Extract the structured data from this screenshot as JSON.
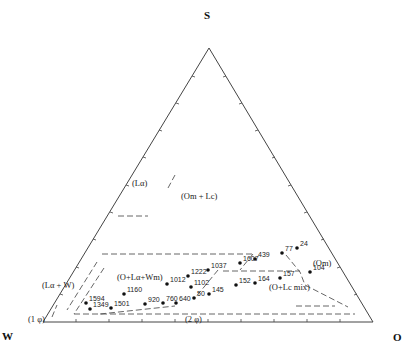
{
  "diagram": {
    "type": "ternary phase diagram",
    "vertices": {
      "top": "S",
      "left": "W",
      "right": "O"
    },
    "regions": {
      "l_alpha": "(Lα)",
      "om_lc": "(Om + Lc)",
      "o_lalpha_wm": "(O+Lα+Wm)",
      "om": "(Om)",
      "l_alpha_w": "(Lα + W)",
      "one_phi": "(1 φ)",
      "two_phi": "(2 φ)",
      "o_lc_mix": "(O+Lc mix)"
    },
    "points": [
      {
        "label": "24",
        "x": 297,
        "y": 248
      },
      {
        "label": "77",
        "x": 282,
        "y": 253
      },
      {
        "label": "439",
        "x": 255,
        "y": 259
      },
      {
        "label": "1607",
        "x": 240,
        "y": 263
      },
      {
        "label": "1037",
        "x": 208,
        "y": 270
      },
      {
        "label": "1222",
        "x": 188,
        "y": 276
      },
      {
        "label": "157",
        "x": 280,
        "y": 278
      },
      {
        "label": "104",
        "x": 310,
        "y": 272
      },
      {
        "label": "1012",
        "x": 167,
        "y": 284
      },
      {
        "label": "1102",
        "x": 191,
        "y": 287
      },
      {
        "label": "1160",
        "x": 124,
        "y": 294
      },
      {
        "label": "164",
        "x": 255,
        "y": 283
      },
      {
        "label": "152",
        "x": 236,
        "y": 285
      },
      {
        "label": "145",
        "x": 209,
        "y": 294
      },
      {
        "label": "50",
        "x": 194,
        "y": 298
      },
      {
        "label": "1594",
        "x": 86,
        "y": 303
      },
      {
        "label": "640",
        "x": 176,
        "y": 303
      },
      {
        "label": "760",
        "x": 163,
        "y": 303
      },
      {
        "label": "920",
        "x": 145,
        "y": 304
      },
      {
        "label": "1501",
        "x": 111,
        "y": 308
      },
      {
        "label": "1349",
        "x": 90,
        "y": 309
      }
    ]
  }
}
